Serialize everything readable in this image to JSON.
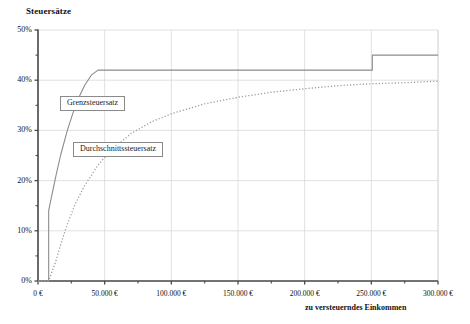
{
  "chart_data": {
    "type": "line",
    "title": "",
    "ylabel": "Steuersätze",
    "xlabel": "zu versteuerndes Einkommen",
    "xlim": [
      0,
      300000
    ],
    "ylim": [
      0,
      0.5
    ],
    "grid": true,
    "legend_position": "inline-callout",
    "xticks": [
      "0 €",
      "50.000 €",
      "100.000 €",
      "150.000 €",
      "200.000 €",
      "250.000 €",
      "300.000 €"
    ],
    "xtick_values": [
      0,
      50000,
      100000,
      150000,
      200000,
      250000,
      300000
    ],
    "yticks": [
      "0%",
      "10%",
      "20%",
      "30%",
      "40%",
      "50%"
    ],
    "ytick_values": [
      0,
      10,
      20,
      30,
      40,
      50
    ],
    "yminor_values": [
      5,
      15,
      25,
      35,
      45
    ],
    "series": [
      {
        "name": "Grenzsteuersatz",
        "style": "solid",
        "color": "#8c8c8c",
        "x": [
          0,
          8004,
          8005,
          10000,
          13469,
          17000,
          22000,
          26000,
          30000,
          35000,
          40000,
          45000,
          52882,
          60000,
          100000,
          150000,
          200000,
          250730,
          250731,
          300000
        ],
        "y": [
          0,
          0,
          14.0,
          16.6,
          21.0,
          25.1,
          30.0,
          33.3,
          36.2,
          39.0,
          41.0,
          42.0,
          42.0,
          42.0,
          42.0,
          42.0,
          42.0,
          42.0,
          45.0,
          45.0
        ]
      },
      {
        "name": "Durchschnittssteuersatz",
        "style": "dotted",
        "color": "#9a9a9a",
        "x": [
          0,
          8004,
          10000,
          13469,
          17000,
          22000,
          28000,
          35000,
          45000,
          55000,
          70000,
          85000,
          100000,
          125000,
          150000,
          175000,
          200000,
          225000,
          250730,
          275000,
          300000
        ],
        "y": [
          0,
          0,
          1.5,
          4.0,
          7.3,
          11.3,
          15.4,
          19.0,
          23.1,
          26.1,
          29.4,
          31.7,
          33.3,
          35.3,
          36.6,
          37.6,
          38.3,
          38.9,
          39.3,
          39.5,
          39.8
        ]
      }
    ],
    "annotations": [
      {
        "label": "Grenzsteuersatz"
      },
      {
        "label": "Durchschnittssteuersatz"
      }
    ]
  },
  "axis": {
    "y_title": "Steuersätze",
    "x_title": "zu versteuerndes Einkommen"
  },
  "labels": {
    "marginal": "Grenzsteuersatz",
    "average": "Durchschnittssteuersatz"
  },
  "colors": {
    "marginal_line": "#8c8c8c",
    "average_line": "#9a9a9a",
    "grid": "#d9d9d9",
    "axis": "#4a4a4a",
    "background": "#ffffff"
  }
}
